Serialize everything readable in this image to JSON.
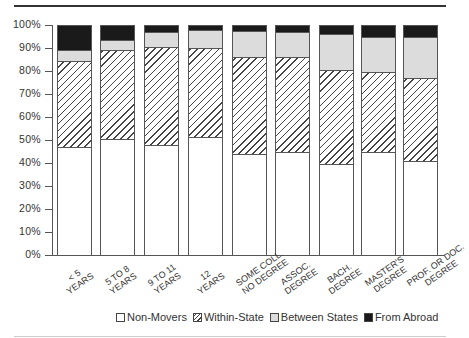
{
  "chart_data": {
    "type": "bar",
    "stacked": true,
    "title": "",
    "xlabel": "",
    "ylabel": "",
    "ylim": [
      0,
      100
    ],
    "yticks": [
      "0%",
      "10%",
      "20%",
      "30%",
      "40%",
      "50%",
      "60%",
      "70%",
      "80%",
      "90%",
      "100%"
    ],
    "grid": false,
    "legend_position": "bottom",
    "categories": [
      "< 5 YEARS",
      "5 TO 8 YEARS",
      "9 TO 11 YEARS",
      "12 YEARS",
      "SOME COLL. NO DEGREE",
      "ASSOC. DEGREE",
      "BACH. DEGREE",
      "MASTER'S DEGREE",
      "PROF. OR DOC. DEGREE"
    ],
    "category_lines": [
      [
        "< 5",
        "YEARS"
      ],
      [
        "5 TO 8",
        "YEARS"
      ],
      [
        "9 TO 11",
        "YEARS"
      ],
      [
        "12",
        "YEARS"
      ],
      [
        "SOME COLL.",
        "NO DEGREE"
      ],
      [
        "ASSOC.",
        "DEGREE"
      ],
      [
        "BACH.",
        "DEGREE"
      ],
      [
        "MASTER'S",
        "DEGREE"
      ],
      [
        "PROF. OR DOC.",
        "DEGREE"
      ]
    ],
    "series": [
      {
        "name": "Non-Movers",
        "values": [
          47,
          50.5,
          48,
          51.5,
          44,
          45,
          39.5,
          45,
          41
        ]
      },
      {
        "name": "Within-State",
        "values": [
          37.5,
          38.5,
          42.5,
          38.5,
          42,
          41.3,
          41,
          34.5,
          36
        ]
      },
      {
        "name": "Between States",
        "values": [
          4.5,
          4.5,
          6.5,
          8,
          11.5,
          10.7,
          15.5,
          15.5,
          17.6
        ]
      },
      {
        "name": "From Abroad",
        "values": [
          11,
          6.5,
          3,
          2,
          2.5,
          3,
          4,
          5,
          5.4
        ]
      }
    ],
    "colors": {
      "Non-Movers": "#ffffff",
      "Within-State": "hatched",
      "Between States": "#dcdcdc",
      "From Abroad": "#1a1a1a"
    }
  },
  "legend": {
    "items": [
      {
        "label": "Non-Movers"
      },
      {
        "label": "Within-State"
      },
      {
        "label": "Between States"
      },
      {
        "label": "From Abroad"
      }
    ]
  }
}
